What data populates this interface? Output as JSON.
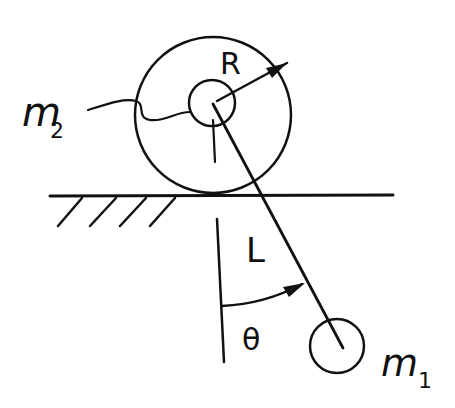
{
  "diagram": {
    "title": "",
    "labels": {
      "m2": "m",
      "m2_sub": "2",
      "m1": "m",
      "m1_sub": "1",
      "radius": "R",
      "length": "L",
      "angle": "θ"
    },
    "colors": {
      "ink": "#111111",
      "background": "#ffffff"
    },
    "elements": {
      "disk_outer": {
        "cx": 213,
        "cy": 115,
        "r": 78
      },
      "disk_hub": {
        "cx": 212,
        "cy": 103,
        "r": 23
      },
      "ground_y": 196,
      "pendulum_pivot": [
        212,
        104
      ],
      "pendulum_bob": {
        "cx": 337,
        "cy": 345,
        "r": 27
      },
      "vertical_ref_x": 218
    }
  }
}
